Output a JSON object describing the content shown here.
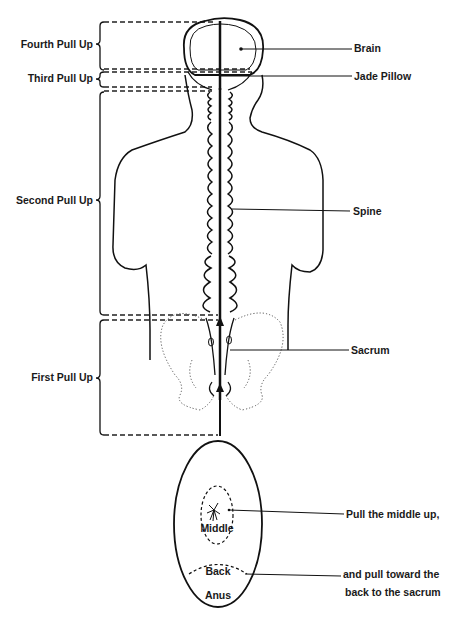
{
  "diagram": {
    "left_labels": [
      {
        "id": "fourth",
        "text": "Fourth Pull Up"
      },
      {
        "id": "third",
        "text": "Third Pull Up"
      },
      {
        "id": "second",
        "text": "Second Pull Up"
      },
      {
        "id": "first",
        "text": "First Pull Up"
      }
    ],
    "right_labels": [
      {
        "id": "brain",
        "text": "Brain"
      },
      {
        "id": "jade_pillow",
        "text": "Jade Pillow"
      },
      {
        "id": "spine",
        "text": "Spine"
      },
      {
        "id": "sacrum",
        "text": "Sacrum"
      }
    ],
    "perineum": {
      "middle_label": "Middle",
      "back_label": "Back",
      "anus_label": "Anus",
      "instruction_1": "Pull the middle up,",
      "instruction_2_line1": "and pull toward the",
      "instruction_2_line2": "back to the sacrum"
    }
  }
}
